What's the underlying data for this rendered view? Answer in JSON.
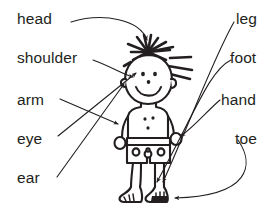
{
  "diagram": {
    "background_color": "#ffffff",
    "ink_color": "#231f20",
    "labels_left": [
      {
        "id": "head",
        "text": "head",
        "target": "top of head / hair"
      },
      {
        "id": "shoulder",
        "text": "shoulder",
        "target": "left shoulder"
      },
      {
        "id": "arm",
        "text": "arm",
        "target": "left arm"
      },
      {
        "id": "eye",
        "text": "eye",
        "target": "eye on face"
      },
      {
        "id": "ear",
        "text": "ear",
        "target": "ear at side of head"
      }
    ],
    "labels_right": [
      {
        "id": "leg",
        "text": "leg",
        "target": "right leg"
      },
      {
        "id": "foot",
        "text": "foot",
        "target": "right foot"
      },
      {
        "id": "hand",
        "text": "hand",
        "target": "right hand"
      },
      {
        "id": "toe",
        "text": "toe",
        "target": "toes of right foot"
      }
    ],
    "figure": {
      "name": "stick-figure-child",
      "features": [
        "spiky hair",
        "smiling face",
        "two eyes",
        "nose",
        "ear",
        "arms",
        "hands",
        "shorts with circles",
        "legs",
        "bare feet with toes"
      ]
    }
  }
}
